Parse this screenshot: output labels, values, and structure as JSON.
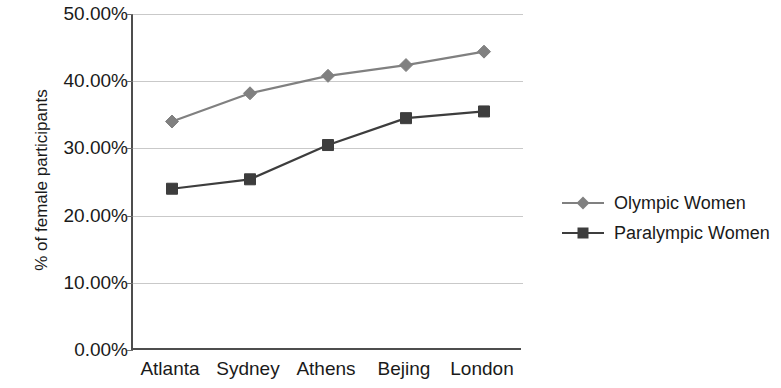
{
  "chart_data": {
    "type": "line",
    "title": "",
    "subtitle": "",
    "xlabel": "",
    "ylabel": "% of female participants",
    "categories": [
      "Atlanta",
      "Sydney",
      "Athens",
      "Bejing",
      "London"
    ],
    "ylim": [
      0,
      50
    ],
    "ytick_values": [
      50,
      40,
      30,
      20,
      10,
      0
    ],
    "ytick_labels": [
      "50.00%",
      "40.00%",
      "30.00%",
      "20.00%",
      "10.00%",
      "0.00%"
    ],
    "grid": true,
    "legend_position": "right",
    "series": [
      {
        "name": "Olympic Women",
        "marker": "diamond",
        "color": "#808080",
        "values": [
          34.0,
          38.2,
          40.8,
          42.4,
          44.4
        ]
      },
      {
        "name": "Paralympic Women",
        "marker": "square",
        "color": "#3d3d3d",
        "values": [
          24.0,
          25.4,
          30.5,
          34.5,
          35.5
        ]
      }
    ]
  },
  "axes": {
    "y_title": "% of female participants"
  },
  "legend": {
    "items": [
      {
        "label": "Olympic Women",
        "marker": "diamond-marker",
        "color": "#808080"
      },
      {
        "label": "Paralympic Women",
        "marker": "square-marker",
        "color": "#3d3d3d"
      }
    ]
  }
}
